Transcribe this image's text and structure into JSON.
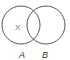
{
  "diagram": {
    "type": "venn",
    "sets": [
      {
        "label": "A",
        "cx": 21,
        "cy": 25,
        "r": 19
      },
      {
        "label": "B",
        "cx": 46,
        "cy": 25,
        "r": 19
      }
    ],
    "region_labels": [
      {
        "text": "X",
        "region": "A only"
      }
    ],
    "stroke_color": "#555555"
  }
}
